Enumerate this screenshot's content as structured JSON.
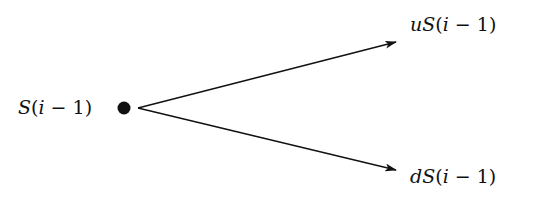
{
  "diagram": {
    "type": "binomial-tree-one-step",
    "root": {
      "label": "S(i − 1)",
      "label_parts": {
        "var": "S",
        "open": "(",
        "idx": "i",
        "op": " − ",
        "num": "1",
        "close": ")"
      }
    },
    "up": {
      "label": "uS(i − 1)",
      "label_parts": {
        "factor": "u",
        "var": "S",
        "open": "(",
        "idx": "i",
        "op": " − ",
        "num": "1",
        "close": ")"
      }
    },
    "down": {
      "label": "dS(i − 1)",
      "label_parts": {
        "factor": "d",
        "var": "S",
        "open": "(",
        "idx": "i",
        "op": " − ",
        "num": "1",
        "close": ")"
      }
    },
    "colors": {
      "ink": "#111111",
      "background": "#ffffff"
    }
  }
}
